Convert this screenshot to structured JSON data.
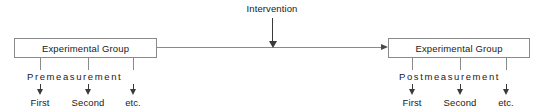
{
  "diagram": {
    "title_text": "",
    "intervention": {
      "label": "Intervention",
      "arrow_direction": "down",
      "x": 272
    },
    "connector": {
      "direction": "left-to-right",
      "arrow_direction": "right"
    },
    "colors": {
      "box_border": "#8a8a8a",
      "arrow": "#3a3a3a",
      "text": "#1a1a1a",
      "background": "#ffffff"
    },
    "groups": [
      {
        "id": "pre",
        "box_label": "Experimental Group",
        "phase_caption": "Premeasurement",
        "box_x": 14,
        "box_width": 143,
        "ticks": [
          40,
          88,
          133
        ],
        "measurements": [
          {
            "label": "First",
            "x": 40
          },
          {
            "label": "Second",
            "x": 88
          },
          {
            "label": "etc.",
            "x": 133
          }
        ]
      },
      {
        "id": "post",
        "box_label": "Experimental Group",
        "phase_caption": "Postmeasurement",
        "box_x": 388,
        "box_width": 142,
        "ticks": [
          412,
          460,
          506
        ],
        "measurements": [
          {
            "label": "First",
            "x": 412
          },
          {
            "label": "Second",
            "x": 460
          },
          {
            "label": "etc.",
            "x": 506
          }
        ]
      }
    ]
  }
}
